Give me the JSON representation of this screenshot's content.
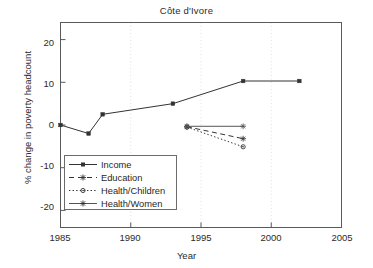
{
  "chart_data": {
    "type": "line",
    "title": "Côte d'Ivore",
    "xlabel": "Year",
    "ylabel": "% change in poverty headcount",
    "xlim": [
      1985,
      2005
    ],
    "ylim": [
      -24,
      24
    ],
    "xticks": [
      1985,
      1990,
      1995,
      2000,
      2005
    ],
    "yticks": [
      20,
      10,
      0,
      -10,
      -20
    ],
    "grid": "faint dotted vertical gridlines at x ticks",
    "legend_position": "lower left inside axes",
    "series": [
      {
        "name": "Income",
        "linestyle": "solid",
        "marker": "square",
        "color": "#333333",
        "x": [
          1985,
          1987,
          1988,
          1993,
          1998,
          2002
        ],
        "y": [
          0,
          -2,
          2.5,
          5,
          10.3,
          10.3
        ]
      },
      {
        "name": "Education",
        "linestyle": "dashed",
        "marker": "star",
        "color": "#333333",
        "x": [
          1994,
          1998
        ],
        "y": [
          -0.4,
          -3.2
        ]
      },
      {
        "name": "Health/Children",
        "linestyle": "dotted",
        "marker": "circle",
        "color": "#333333",
        "x": [
          1994,
          1998
        ],
        "y": [
          -0.5,
          -5.1
        ]
      },
      {
        "name": "Health/Women",
        "linestyle": "solid",
        "marker": "star",
        "color": "#555555",
        "x": [
          1994,
          1998
        ],
        "y": [
          -0.3,
          -0.3
        ]
      }
    ]
  },
  "axis": {
    "ytick_labels": [
      "20",
      "10",
      "0",
      "-10",
      "-20"
    ],
    "xtick_labels": [
      "1985",
      "1990",
      "1995",
      "2000",
      "2005"
    ]
  },
  "legend": {
    "entries": [
      {
        "label": "Income"
      },
      {
        "label": "Education"
      },
      {
        "label": "Health/Children"
      },
      {
        "label": "Health/Women"
      }
    ]
  }
}
